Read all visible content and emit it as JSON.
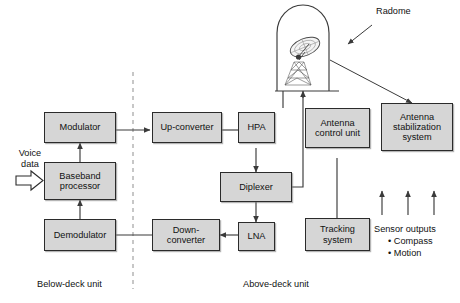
{
  "diagram": {
    "colors": {
      "box_fill": "#d6d6d6",
      "box_border": "#2b2b2b",
      "line": "#3a3a3a",
      "divider": "#9a9a9a",
      "text": "#111111"
    },
    "blocks": [
      {
        "id": "modulator",
        "label": "Modulator"
      },
      {
        "id": "baseband",
        "label": "Baseband\nprocessor"
      },
      {
        "id": "demodulator",
        "label": "Demodulator"
      },
      {
        "id": "upconverter",
        "label": "Up-converter"
      },
      {
        "id": "hpa",
        "label": "HPA"
      },
      {
        "id": "diplexer",
        "label": "Diplexer"
      },
      {
        "id": "lna",
        "label": "LNA"
      },
      {
        "id": "downconverter",
        "label": "Down-\nconverter"
      },
      {
        "id": "acu",
        "label": "Antenna\ncontrol unit"
      },
      {
        "id": "tracking",
        "label": "Tracking\nsystem"
      },
      {
        "id": "stabilization",
        "label": "Antenna\nstabilization\nsystem"
      }
    ],
    "labels": {
      "voice_data": "Voice\ndata",
      "radome": "Radome",
      "sensor_outputs": "Sensor outputs",
      "sensor_item_1": "• Compass",
      "sensor_item_2": "• Motion",
      "below_deck": "Below-deck unit",
      "above_deck": "Above-deck unit"
    }
  }
}
